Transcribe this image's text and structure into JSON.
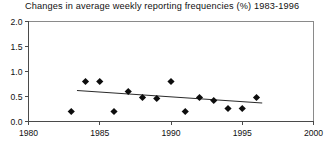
{
  "chart_data": {
    "type": "scatter",
    "title": "Changes in average weekly reporting frequencies (%) 1983-1996",
    "xlabel": "",
    "ylabel": "",
    "xlim": [
      1980,
      2000
    ],
    "ylim": [
      0.0,
      2.0
    ],
    "xticks": [
      1980,
      1985,
      1990,
      1995,
      2000
    ],
    "xtick_labels": [
      "1980",
      "1985",
      "1990",
      "1995",
      "2000"
    ],
    "yticks": [
      0.0,
      0.5,
      1.0,
      1.5,
      2.0
    ],
    "ytick_labels": [
      "0.0",
      "0.5",
      "1.0",
      "1.5",
      "2.0"
    ],
    "grid": false,
    "legend": false,
    "x": [
      1983,
      1984,
      1985,
      1986,
      1987,
      1988,
      1989,
      1990,
      1991,
      1992,
      1993,
      1994,
      1995,
      1996
    ],
    "values": [
      0.2,
      0.8,
      0.8,
      0.2,
      0.6,
      0.48,
      0.46,
      0.8,
      0.2,
      0.48,
      0.42,
      0.26,
      0.26,
      0.48
    ],
    "marker": "diamond",
    "marker_color": "#0d0d0d",
    "series": [
      {
        "name": "Changes in average weekly reporting frequencies",
        "values": [
          0.2,
          0.8,
          0.8,
          0.2,
          0.6,
          0.48,
          0.46,
          0.8,
          0.2,
          0.48,
          0.42,
          0.26,
          0.26,
          0.48
        ]
      }
    ],
    "trendline": {
      "type": "linear",
      "x_start": 1983.4,
      "y_start": 0.62,
      "x_end": 1996.4,
      "y_end": 0.37,
      "color": "#2b2b2b"
    }
  }
}
